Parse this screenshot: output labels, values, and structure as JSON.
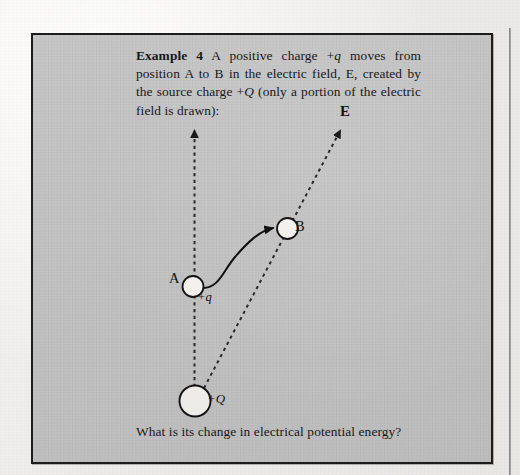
{
  "page": {
    "background_color": "#f1efec",
    "box_fill_color": "#c2c2c2",
    "box_border_color": "#1d1d1d",
    "ink_color": "#17181a"
  },
  "example": {
    "lead_label": "Example 4",
    "prompt_part1": " A positive charge +",
    "prompt_q_italic": "q",
    "prompt_part2": " moves from position A to B in the electric field, E, created by the source charge +",
    "prompt_Q_italic": "Q",
    "prompt_part3": " (only a portion of the electric field is drawn):",
    "question": "What is its change in electrical potential energy?"
  },
  "diagram": {
    "labels": {
      "field_vector": "E",
      "position_a": "A",
      "position_b": "B",
      "test_charge": "+q",
      "source_charge": "+Q"
    },
    "field_lines": [
      {
        "name": "vertical-field-line",
        "x1": 162,
        "y1": 366,
        "x2": 161,
        "y2": 97,
        "style": "dashed",
        "arrow": true
      },
      {
        "name": "diagonal-field-line",
        "x1": 170,
        "y1": 360,
        "x2": 307,
        "y2": 96,
        "style": "dashed",
        "arrow": true
      }
    ],
    "charges": [
      {
        "name": "charge-a",
        "cx": 160,
        "cy": 251,
        "r": 10.5,
        "fill": "#f2f0ec"
      },
      {
        "name": "charge-b",
        "cx": 254,
        "cy": 193,
        "r": 10.5,
        "fill": "#f2f0ec"
      },
      {
        "name": "source-charge",
        "cx": 162,
        "cy": 366,
        "r": 15.5,
        "fill": "#eceae6"
      }
    ],
    "path": {
      "name": "motion-path-a-to-b",
      "description": "curved solid arrow from A to B",
      "arrow": true
    }
  }
}
